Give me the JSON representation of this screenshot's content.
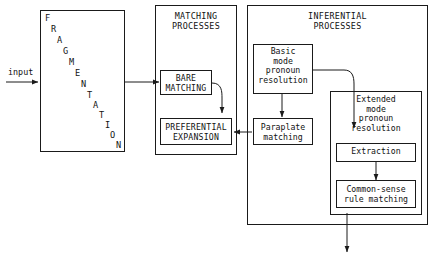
{
  "diagram": {
    "title_visible": false,
    "input_label": "input",
    "containers": [
      {
        "id": "fragmentation",
        "title": "FRAGMENTATION",
        "title_style": "diagonal-letters"
      },
      {
        "id": "matching",
        "title": "MATCHING\nPROCESSES",
        "title_style": "header"
      },
      {
        "id": "inferential",
        "title": "INFERENTIAL\nPROCESSES",
        "title_style": "header"
      }
    ],
    "nodes": [
      {
        "id": "bare-matching",
        "label": "BARE\nMATCHING"
      },
      {
        "id": "preferential-expansion",
        "label": "PREFERENTIAL\nEXPANSION"
      },
      {
        "id": "basic-mode-pronoun-resolution",
        "label": "Basic\nmode\npronoun\nresolution"
      },
      {
        "id": "paraplate-matching",
        "label": "Paraplate\nmatching"
      },
      {
        "id": "extended-mode-pronoun-resolution",
        "label": "Extended\nmode\npronoun\nresolution"
      },
      {
        "id": "extraction",
        "label": "Extraction"
      },
      {
        "id": "common-sense-rule-matching",
        "label": "Common-sense\nrule matching"
      }
    ],
    "fragmentation_letters": [
      "F",
      "R",
      "A",
      "G",
      "M",
      "E",
      "N",
      "T",
      "A",
      "T",
      "I",
      "O",
      "N"
    ],
    "colors": {
      "line": "#1a1a1a",
      "text": "#111111",
      "background": "#ffffff"
    }
  }
}
